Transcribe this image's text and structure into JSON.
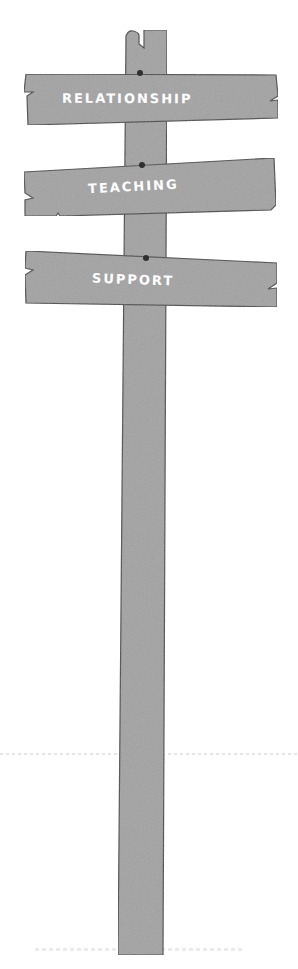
{
  "signpost": {
    "signs": [
      {
        "label": "RELATIONSHIP"
      },
      {
        "label": "TEACHING"
      },
      {
        "label": "SUPPORT"
      }
    ]
  },
  "colors": {
    "wood": "#a3a3a3",
    "outline": "#4a4a4a",
    "nail": "#2f2f2f",
    "text": "#ffffff",
    "background": "#ffffff"
  }
}
